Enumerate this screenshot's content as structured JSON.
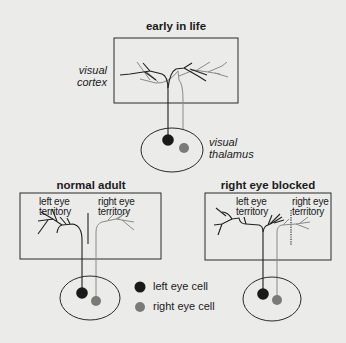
{
  "colors": {
    "background": "#ebebea",
    "left_eye": "#1a1a1a",
    "right_eye": "#7a7a7a",
    "outline": "#2a2a2a"
  },
  "panels": {
    "early": {
      "title": "early in life",
      "cortex_label_line1": "visual",
      "cortex_label_line2": "cortex",
      "thalamus_label_line1": "visual",
      "thalamus_label_line2": "thalamus"
    },
    "normal": {
      "title": "normal adult",
      "left_territory_line1": "left eye",
      "left_territory_line2": "territory",
      "right_territory_line1": "right eye",
      "right_territory_line2": "territory"
    },
    "blocked": {
      "title": "right eye blocked",
      "left_territory_line1": "left eye",
      "left_territory_line2": "territory",
      "right_territory_line1": "right eye",
      "right_territory_line2": "territory"
    }
  },
  "legend": {
    "items": [
      {
        "label": "left eye cell",
        "color": "#1a1a1a"
      },
      {
        "label": "right eye cell",
        "color": "#7a7a7a"
      }
    ]
  }
}
